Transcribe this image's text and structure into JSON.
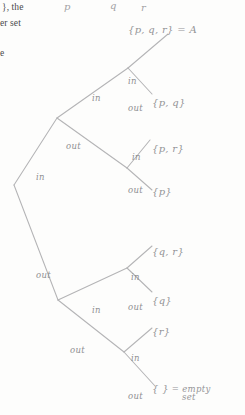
{
  "page": {
    "width": 245,
    "height": 415,
    "background_color": "#fdfdfc",
    "ink_color": "#9a9a9c",
    "line_color": "#b4b4b6",
    "printed_text_color": "#4a4a4a"
  },
  "printed_fragments": [
    {
      "text": "}, the",
      "x": 2,
      "y": 2
    },
    {
      "text": "er set",
      "x": 0,
      "y": 18
    },
    {
      "text": "e",
      "x": 0,
      "y": 48
    }
  ],
  "column_headers": [
    {
      "label": "p",
      "x": 64,
      "y": 1
    },
    {
      "label": "q",
      "x": 110,
      "y": 0
    },
    {
      "label": "r",
      "x": 141,
      "y": 2
    }
  ],
  "root": {
    "label": "{ p , q , r } = A",
    "set_text": "{p, q, r}",
    "equals_text": "= A",
    "x": 128,
    "y": 24
  },
  "edge_labels": [
    {
      "label": "in",
      "x": 128,
      "y": 76,
      "level": 1,
      "branch": "in"
    },
    {
      "label": "out",
      "x": 128,
      "y": 103,
      "level": 1,
      "branch": "out"
    },
    {
      "label": "in",
      "x": 92,
      "y": 93,
      "level": 2,
      "branch": "in"
    },
    {
      "label": "out",
      "x": 66,
      "y": 141,
      "level": 2,
      "branch": "out"
    },
    {
      "label": "in",
      "x": 132,
      "y": 152,
      "level": 3,
      "branch": "in"
    },
    {
      "label": "out",
      "x": 128,
      "y": 185,
      "level": 3,
      "branch": "out"
    },
    {
      "label": "in",
      "x": 36,
      "y": 172,
      "level": 0,
      "branch": "in"
    },
    {
      "label": "out",
      "x": 36,
      "y": 270,
      "level": 0,
      "branch": "out"
    },
    {
      "label": "in",
      "x": 131,
      "y": 272,
      "level": 4,
      "branch": "in"
    },
    {
      "label": "out",
      "x": 128,
      "y": 302,
      "level": 4,
      "branch": "out"
    },
    {
      "label": "in",
      "x": 92,
      "y": 305,
      "level": 5,
      "branch": "in"
    },
    {
      "label": "out",
      "x": 70,
      "y": 345,
      "level": 5,
      "branch": "out"
    },
    {
      "label": "in",
      "x": 131,
      "y": 353,
      "level": 6,
      "branch": "in"
    },
    {
      "label": "out",
      "x": 128,
      "y": 391,
      "level": 6,
      "branch": "out"
    }
  ],
  "leaves": [
    {
      "set_text": "{p, q}",
      "x": 152,
      "y": 97,
      "note": ""
    },
    {
      "set_text": "{p, r}",
      "x": 152,
      "y": 143,
      "note": ""
    },
    {
      "set_text": "{p}",
      "x": 152,
      "y": 186,
      "note": ""
    },
    {
      "set_text": "{q, r}",
      "x": 152,
      "y": 246,
      "note": ""
    },
    {
      "set_text": "{q}",
      "x": 152,
      "y": 295,
      "note": ""
    },
    {
      "set_text": "{r}",
      "x": 152,
      "y": 326,
      "note": ""
    },
    {
      "set_text": "{ }",
      "x": 152,
      "y": 383,
      "note": "= empty set",
      "note_line1": "= empty",
      "note_line2": "set"
    }
  ],
  "tree_edges": {
    "description": "Binary decision tree enumerating all 8 subsets of {p,q,r}; each level decides in/out for one element.",
    "paths": [
      "M 14 185 L 57 118",
      "M 57 118 L 128 68",
      "M 128 68 L 168 34",
      "M 128 68 L 152 94",
      "M 57 118 L 127 168",
      "M 127 168 L 150 140",
      "M 127 168 L 152 190",
      "M 14 185 L 58 300",
      "M 58 300 L 127 268",
      "M 127 268 L 152 246",
      "M 127 268 L 152 292",
      "M 58 300 L 124 352",
      "M 124 352 L 152 328",
      "M 124 352 L 155 386"
    ]
  }
}
